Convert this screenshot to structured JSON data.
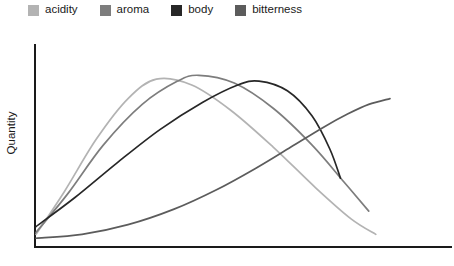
{
  "chart_data": {
    "type": "line",
    "title": "",
    "xlabel": "",
    "ylabel": "Quantity",
    "xlim": [
      0,
      100
    ],
    "ylim": [
      0,
      100
    ],
    "grid": false,
    "axis_ticks": false,
    "tick_labels": [],
    "legend_position": "top-left",
    "series": [
      {
        "name": "acidity",
        "color": "#b3b3b3",
        "peak_x": 34,
        "peak_y": 86,
        "points": [
          {
            "x": 0,
            "y": 6
          },
          {
            "x": 8,
            "y": 28
          },
          {
            "x": 17,
            "y": 55
          },
          {
            "x": 26,
            "y": 76
          },
          {
            "x": 34,
            "y": 86
          },
          {
            "x": 44,
            "y": 83
          },
          {
            "x": 55,
            "y": 70
          },
          {
            "x": 67,
            "y": 51
          },
          {
            "x": 79,
            "y": 30
          },
          {
            "x": 89,
            "y": 14
          },
          {
            "x": 96,
            "y": 6
          }
        ]
      },
      {
        "name": "aroma",
        "color": "#7d7d7d",
        "peak_x": 46,
        "peak_y": 88,
        "points": [
          {
            "x": 0,
            "y": 7
          },
          {
            "x": 9,
            "y": 27
          },
          {
            "x": 19,
            "y": 52
          },
          {
            "x": 30,
            "y": 73
          },
          {
            "x": 40,
            "y": 85
          },
          {
            "x": 46,
            "y": 88
          },
          {
            "x": 56,
            "y": 84
          },
          {
            "x": 67,
            "y": 71
          },
          {
            "x": 78,
            "y": 52
          },
          {
            "x": 87,
            "y": 33
          },
          {
            "x": 94,
            "y": 18
          }
        ]
      },
      {
        "name": "body",
        "color": "#272727",
        "peak_x": 63,
        "peak_y": 85,
        "points": [
          {
            "x": 0,
            "y": 10
          },
          {
            "x": 11,
            "y": 25
          },
          {
            "x": 23,
            "y": 43
          },
          {
            "x": 35,
            "y": 60
          },
          {
            "x": 47,
            "y": 74
          },
          {
            "x": 57,
            "y": 83
          },
          {
            "x": 63,
            "y": 85
          },
          {
            "x": 71,
            "y": 80
          },
          {
            "x": 78,
            "y": 67
          },
          {
            "x": 83,
            "y": 50
          },
          {
            "x": 86,
            "y": 35
          }
        ]
      },
      {
        "name": "bitterness",
        "color": "#5c5c5c",
        "peak_x": 100,
        "peak_y": 76,
        "points": [
          {
            "x": 0,
            "y": 4
          },
          {
            "x": 13,
            "y": 6
          },
          {
            "x": 26,
            "y": 11
          },
          {
            "x": 39,
            "y": 19
          },
          {
            "x": 51,
            "y": 29
          },
          {
            "x": 62,
            "y": 40
          },
          {
            "x": 72,
            "y": 51
          },
          {
            "x": 81,
            "y": 61
          },
          {
            "x": 88,
            "y": 68
          },
          {
            "x": 94,
            "y": 73
          },
          {
            "x": 100,
            "y": 76
          }
        ]
      }
    ]
  },
  "legend": {
    "items": [
      {
        "label": "acidity",
        "color": "#b3b3b3"
      },
      {
        "label": "aroma",
        "color": "#7d7d7d"
      },
      {
        "label": "body",
        "color": "#272727"
      },
      {
        "label": "bitterness",
        "color": "#5c5c5c"
      }
    ]
  },
  "axes": {
    "y_title": "Quantity",
    "axis_color": "#1a1a1a"
  }
}
